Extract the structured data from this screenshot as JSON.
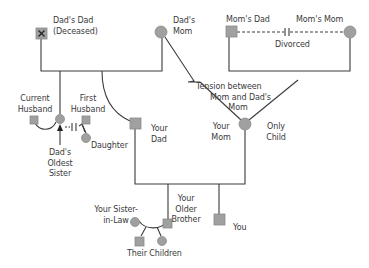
{
  "colors": {
    "line": "#3a3a3a",
    "node_fill": "#a0a0a0",
    "node_stroke": "#8a8a8a",
    "text": "#3a3a3a",
    "background": "#ffffff"
  },
  "people": {
    "dads_dad": {
      "line1": "Dad's Dad",
      "line2": "(Deceased)",
      "symbol": "square",
      "marker": "X",
      "status": "deceased"
    },
    "dads_mom": {
      "line1": "Dad's",
      "line2": "Mom",
      "symbol": "circle"
    },
    "moms_dad": {
      "label": "Mom's Dad",
      "symbol": "square"
    },
    "moms_mom": {
      "label": "Mom's Mom",
      "symbol": "circle"
    },
    "current_husband": {
      "line1": "Current",
      "line2": "Husband",
      "symbol": "square"
    },
    "first_husband": {
      "line1": "First",
      "line2": "Husband",
      "symbol": "square"
    },
    "dads_oldest_sister": {
      "line1": "Dad's",
      "line2": "Oldest",
      "line3": "Sister",
      "symbol": "circle"
    },
    "daughter": {
      "label": "Daughter",
      "symbol": "circle"
    },
    "your_dad": {
      "line1": "Your",
      "line2": "Dad",
      "symbol": "square"
    },
    "your_mom": {
      "line1": "Your",
      "line2": "Mom",
      "symbol": "circle"
    },
    "only_child_note": {
      "line1": "Only",
      "line2": "Child"
    },
    "your_sister_in_law": {
      "line1": "Your Sister-",
      "line2": "in-Law",
      "symbol": "circle"
    },
    "your_older_brother": {
      "line1": "Your",
      "line2": "Older",
      "line3": "Brother",
      "symbol": "square"
    },
    "you": {
      "label": "You",
      "symbol": "square"
    },
    "their_children": {
      "label": "Their Children",
      "symbols": [
        "square",
        "circle"
      ]
    }
  },
  "relationships": {
    "divorced": {
      "label": "Divorced",
      "between": [
        "Mom's Dad",
        "Mom's Mom"
      ],
      "style": "dashed-with-break"
    },
    "tension": {
      "line1": "Tension between",
      "line2": "Mom and Dad's",
      "line3": "Mom",
      "between": [
        "Your Mom",
        "Dad's Mom"
      ],
      "style": "zigzag"
    },
    "sister_divorce": {
      "between": [
        "Dad's Oldest Sister",
        "First Husband"
      ],
      "style": "dashed-with-break"
    }
  }
}
